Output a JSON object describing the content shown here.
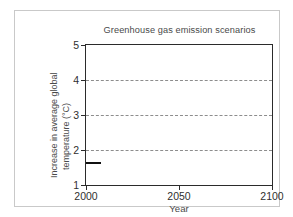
{
  "chart_data": {
    "type": "line",
    "title": "Greenhouse gas emission scenarios",
    "xlabel": "Year",
    "ylabel": "Increase in average global temperature (°C)",
    "ylabel_line1": "Increase in average global",
    "ylabel_line2": "temperature (°C)",
    "xlim": [
      2000,
      2100
    ],
    "ylim": [
      1,
      5
    ],
    "x_ticks": [
      2000,
      2050,
      2100
    ],
    "x_tick_labels": [
      "2000",
      "2050",
      "2100"
    ],
    "y_ticks": [
      1,
      2,
      3,
      4,
      5
    ],
    "y_tick_labels": [
      "1",
      "2",
      "3",
      "4",
      "5"
    ],
    "grid": {
      "horizontal": true,
      "vertical": false,
      "style": "dashed",
      "at": [
        2,
        3,
        4
      ],
      "color": "#8d8d8d"
    },
    "legend": null,
    "annotations": [],
    "series": [
      {
        "name": "observed-baseline",
        "color": "#111111",
        "x": [
          2000,
          2008
        ],
        "values": [
          1.65,
          1.65
        ]
      }
    ]
  },
  "figure": {
    "frame_color": "#c9c9c9",
    "axis_color": "#2b2b2b",
    "background": "#ffffff"
  }
}
